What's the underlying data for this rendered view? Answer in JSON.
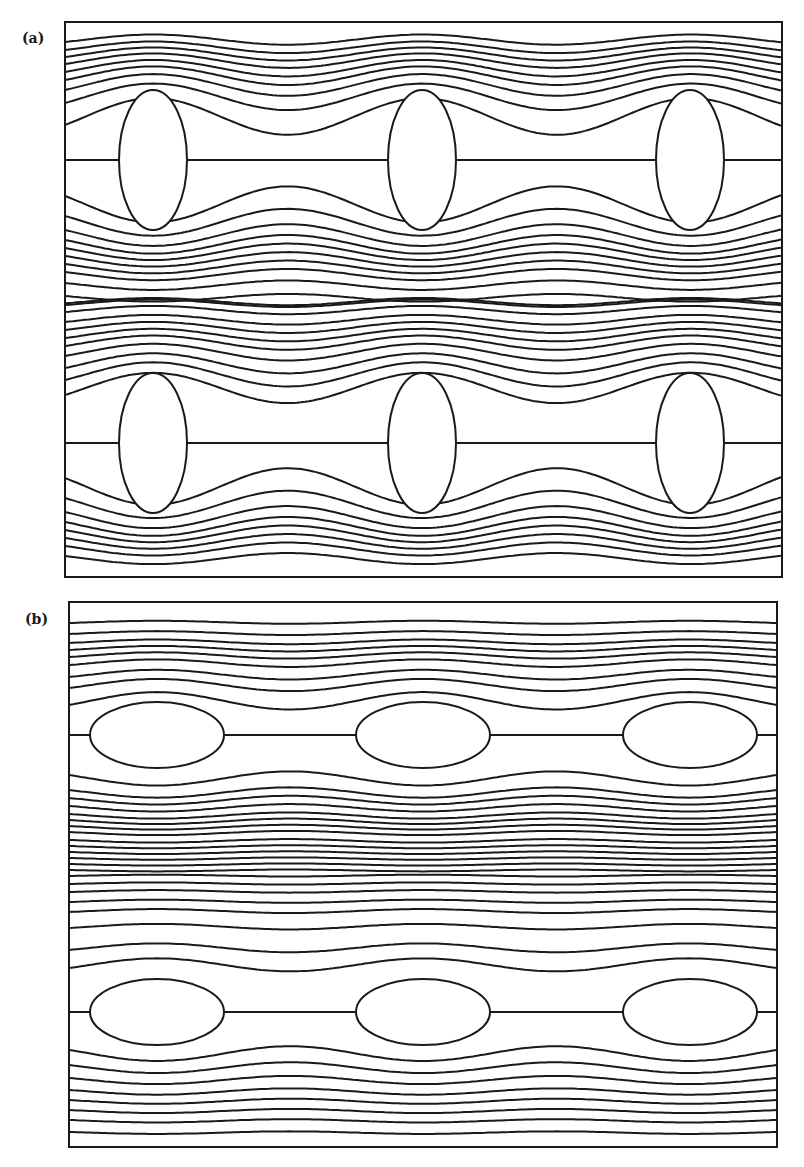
{
  "figure": {
    "stroke_color": "#1a1a1a",
    "background": "#ffffff"
  },
  "chart_data": [
    {
      "type": "diagram",
      "title": "",
      "label": "(a)",
      "description": "Streamlines of flow past a periodic array of vertically elongated elliptical obstacles, two rows",
      "frame": {
        "x": 65,
        "y": 22,
        "width": 717,
        "height": 555
      },
      "ellipse_orientation": "vertical",
      "ellipse_rx": 34,
      "ellipse_ry": 70,
      "columns_cx": [
        153,
        422,
        690
      ],
      "rows_cy": [
        160,
        443
      ],
      "wavelength": 269,
      "streamlines_above_top_row_left_edge_y": [
        42,
        50,
        57,
        64,
        72,
        80,
        90,
        103,
        125
      ],
      "streamlines_between_rows_left_edge_y": [
        196,
        216,
        230,
        240,
        248,
        256,
        264,
        272,
        283,
        296,
        300,
        305,
        312,
        322,
        330,
        338,
        346,
        356,
        368,
        380,
        395
      ],
      "streamlines_below_bottom_row_left_edge_y": [
        478,
        498,
        512,
        522,
        530,
        538,
        546,
        556
      ],
      "deflection_amplitude_near": 60,
      "amplitude_decay": 60
    },
    {
      "type": "diagram",
      "title": "",
      "label": "(b)",
      "description": "Streamlines of flow past a periodic array of horizontally elongated elliptical obstacles, two rows",
      "frame": {
        "x": 69,
        "y": 602,
        "width": 708,
        "height": 545
      },
      "ellipse_orientation": "horizontal",
      "ellipse_rx": 67,
      "ellipse_ry": 33,
      "columns_cx": [
        157,
        423,
        690
      ],
      "rows_cy": [
        735,
        1012
      ],
      "wavelength": 266,
      "streamlines_above_top_row_left_edge_y": [
        623,
        634,
        643,
        650,
        657,
        665,
        677,
        688,
        705
      ],
      "streamlines_between_rows_left_edge_y": [
        775,
        790,
        798,
        806,
        814,
        820,
        826,
        832,
        840,
        846,
        852,
        858,
        864,
        870,
        876,
        884,
        892,
        902,
        912,
        928,
        950,
        968
      ],
      "streamlines_below_bottom_row_left_edge_y": [
        1050,
        1065,
        1078,
        1090,
        1100,
        1110,
        1120,
        1132
      ],
      "deflection_amplitude_near": 32,
      "amplitude_decay": 45
    }
  ],
  "labels": {
    "panel_a": "(a)",
    "panel_b": "(b)"
  },
  "caption": ""
}
